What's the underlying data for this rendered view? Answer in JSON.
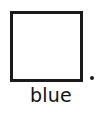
{
  "figure": {
    "type": "color-swatch-with-caption",
    "background_color": "#ffffff"
  },
  "swatch": {
    "name": "square-outline",
    "shape": "square",
    "fill_color": "#ffffff",
    "border_color": "#1a1a1a",
    "border_width_px": 3.5,
    "width_px": 73,
    "height_px": 71
  },
  "punctuation": {
    "period": ".",
    "color": "#1a1a1a"
  },
  "caption": {
    "label": "blue",
    "color": "#111111"
  }
}
